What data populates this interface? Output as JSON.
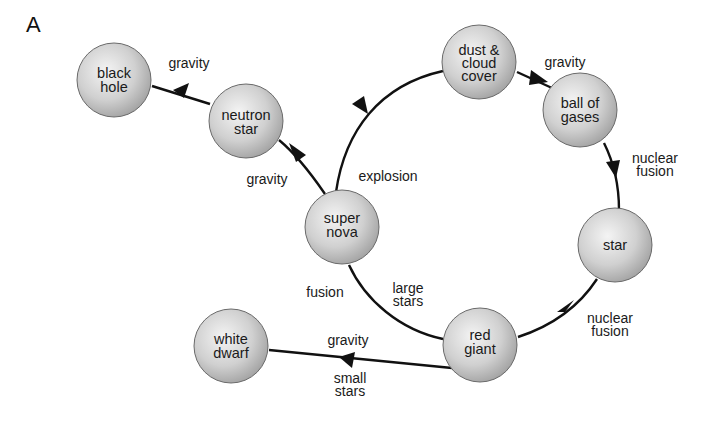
{
  "panel_label": "A",
  "colors": {
    "ball_light": "#f2f2f2",
    "ball_dark": "#a9a9a9",
    "line": "#111111",
    "text": "#1a1a1a"
  },
  "nodes": {
    "dust": {
      "line1": "dust &",
      "line2": "cloud",
      "line3": "cover"
    },
    "ball": {
      "line1": "ball of",
      "line2": "gases"
    },
    "star": {
      "line1": "star"
    },
    "redgiant": {
      "line1": "red",
      "line2": "giant"
    },
    "supernova": {
      "line1": "super",
      "line2": "nova"
    },
    "neutron": {
      "line1": "neutron",
      "line2": "star"
    },
    "blackhole": {
      "line1": "black",
      "line2": "hole"
    },
    "whitedwarf": {
      "line1": "white",
      "line2": "dwarf"
    }
  },
  "edges": {
    "dust_to_ball": "gravity",
    "ball_to_star": {
      "line1": "nuclear",
      "line2": "fusion"
    },
    "star_to_redgiant": {
      "line1": "nuclear",
      "line2": "fusion"
    },
    "redgiant_to_supernova": {
      "line1": "large",
      "line2": "stars"
    },
    "redgiant_to_supernova_side": "fusion",
    "supernova_to_dust": "explosion",
    "supernova_to_neutron": "gravity",
    "neutron_to_blackhole": "gravity",
    "redgiant_to_whitedwarf_top": "gravity",
    "redgiant_to_whitedwarf_bottom": {
      "line1": "small",
      "line2": "stars"
    }
  }
}
